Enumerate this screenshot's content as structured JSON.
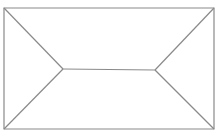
{
  "diagram": {
    "type": "hip-roof-plan",
    "width": 217,
    "height": 136,
    "background": "#ffffff",
    "stroke_color": "#8a8a8a",
    "stroke_width": 1.2,
    "outline": {
      "x1": 4,
      "y1": 8,
      "x2": 214,
      "y2": 129
    },
    "ridge": {
      "x1": 63,
      "y1": 69,
      "x2": 155,
      "y2": 70
    },
    "hips": [
      {
        "name": "hip-top-left",
        "x1": 4,
        "y1": 8,
        "x2": 63,
        "y2": 69
      },
      {
        "name": "hip-bottom-left",
        "x1": 4,
        "y1": 129,
        "x2": 63,
        "y2": 69
      },
      {
        "name": "hip-top-right",
        "x1": 214,
        "y1": 8,
        "x2": 155,
        "y2": 70
      },
      {
        "name": "hip-bottom-right",
        "x1": 214,
        "y1": 129,
        "x2": 155,
        "y2": 70
      }
    ]
  }
}
